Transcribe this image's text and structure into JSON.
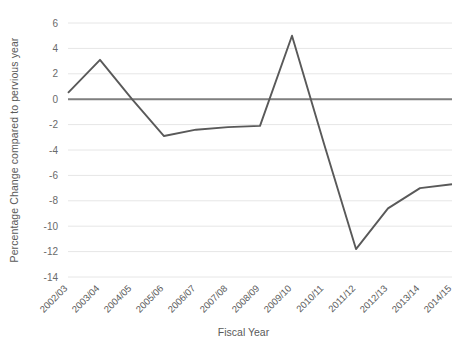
{
  "chart_data": {
    "type": "line",
    "title": "",
    "xlabel": "Fiscal Year",
    "ylabel": "Percentage Change compared to pervious year",
    "categories": [
      "2002/03",
      "2003/04",
      "2004/05",
      "2005/06",
      "2006/07",
      "2007/08",
      "2008/09",
      "2009/10",
      "2010/11",
      "2011/12",
      "2012/13",
      "2013/14",
      "2014/15"
    ],
    "series": [
      {
        "name": "Percentage change",
        "values": [
          0.5,
          3.1,
          0.0,
          -2.9,
          -2.4,
          -2.2,
          -2.1,
          5.0,
          -3.5,
          -11.8,
          -8.6,
          -7.0,
          -6.7
        ],
        "color": "#595959"
      }
    ],
    "yticks": [
      6,
      4,
      2,
      0,
      -2,
      -4,
      -6,
      -8,
      -10,
      -12,
      -14
    ],
    "ytick_labels": [
      "6",
      "4",
      "2",
      "0",
      "-2",
      "-4",
      "-6",
      "-8",
      "-10",
      "-12",
      "-14"
    ],
    "ylim": [
      -14,
      6
    ],
    "grid": true,
    "grid_color": "#e6e6e6",
    "zero_line": true,
    "zero_line_color": "#7f7f7f",
    "legend": "none",
    "axis_label_color": "#5a5a5a"
  }
}
